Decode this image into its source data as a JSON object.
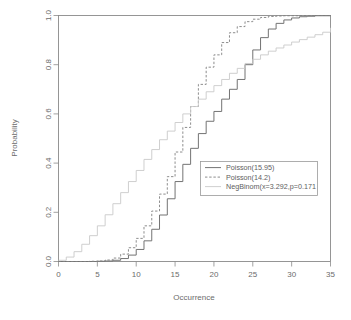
{
  "chart_data": {
    "type": "line",
    "title": "",
    "subtitle": "",
    "xlabel": "Occurrence",
    "ylabel": "Probability",
    "xlim": [
      0,
      35
    ],
    "ylim": [
      0,
      1
    ],
    "grid": false,
    "step_plot": true,
    "legend_position": "bottom-right",
    "x_ticks": [
      0,
      5,
      10,
      15,
      20,
      25,
      30,
      35
    ],
    "x_tick_labels": [
      "0",
      "5",
      "10",
      "15",
      "20",
      "25",
      "30",
      "35"
    ],
    "y_ticks": [
      0.0,
      0.2,
      0.4,
      0.6,
      0.8,
      1.0
    ],
    "y_tick_labels": [
      "0.0",
      "0.2",
      "0.4",
      "0.6",
      "0.8",
      "1.0"
    ],
    "x": [
      0,
      1,
      2,
      3,
      4,
      5,
      6,
      7,
      8,
      9,
      10,
      11,
      12,
      13,
      14,
      15,
      16,
      17,
      18,
      19,
      20,
      21,
      22,
      23,
      24,
      25,
      26,
      27,
      28,
      29,
      30,
      31,
      32,
      33,
      34,
      35
    ],
    "series": [
      {
        "name": "Poisson(15.95)",
        "style": "solid",
        "color": "#777777",
        "values": [
          0.0,
          0.0,
          0.0,
          0.0,
          0.0,
          0.001,
          0.002,
          0.005,
          0.012,
          0.026,
          0.049,
          0.084,
          0.131,
          0.189,
          0.255,
          0.325,
          0.395,
          0.46,
          0.52,
          0.57,
          0.61,
          0.66,
          0.7,
          0.74,
          0.8,
          0.86,
          0.91,
          0.945,
          0.968,
          0.982,
          0.99,
          0.995,
          0.997,
          0.999,
          0.999,
          1.0
        ]
      },
      {
        "name": "Poisson(14.2)",
        "style": "dashed",
        "color": "#777777",
        "values": [
          0.0,
          0.0,
          0.0,
          0.0,
          0.001,
          0.002,
          0.006,
          0.014,
          0.03,
          0.056,
          0.094,
          0.145,
          0.205,
          0.274,
          0.345,
          0.445,
          0.545,
          0.63,
          0.72,
          0.79,
          0.84,
          0.89,
          0.93,
          0.955,
          0.975,
          0.985,
          0.992,
          0.996,
          0.998,
          0.999,
          0.999,
          1.0,
          1.0,
          1.0,
          1.0,
          1.0
        ]
      },
      {
        "name": "NegBinom(x=3.292,p=0.171",
        "style": "solid-light",
        "color": "#c2c2c2",
        "values": [
          0.005,
          0.018,
          0.04,
          0.07,
          0.105,
          0.145,
          0.19,
          0.235,
          0.28,
          0.325,
          0.37,
          0.415,
          0.455,
          0.495,
          0.53,
          0.565,
          0.6,
          0.63,
          0.66,
          0.69,
          0.715,
          0.74,
          0.765,
          0.785,
          0.805,
          0.822,
          0.84,
          0.855,
          0.868,
          0.88,
          0.892,
          0.902,
          0.912,
          0.922,
          0.932,
          0.95
        ]
      }
    ]
  },
  "legend": {
    "items": [
      {
        "label": "Poisson(15.95)",
        "style": "solid"
      },
      {
        "label": "Poisson(14.2)",
        "style": "dashed"
      },
      {
        "label": "NegBinom(x=3.292,p=0.171",
        "style": "solid-light"
      }
    ]
  },
  "axes": {
    "x_title": "Occurrence",
    "y_title": "Probability"
  }
}
